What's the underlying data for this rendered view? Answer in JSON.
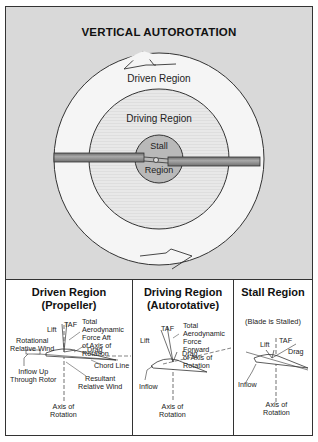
{
  "title": "VERTICAL AUTOROTATION",
  "rotor_diagram": {
    "outer_region_label": "Driven Region",
    "middle_region_label": "Driving Region",
    "inner_region_label_line1": "Stall",
    "inner_region_label_line2": "Region",
    "colors": {
      "background": "#d9d9d9",
      "driven_region": "#f4f4f4",
      "driving_region": "#e6e6e6",
      "stall_region": "#b8b8b8",
      "blade": "#8e8e8e",
      "outline": "#333333"
    }
  },
  "panels": [
    {
      "title_line1": "Driven Region",
      "title_line2": "(Propeller)",
      "labels": {
        "taf_desc_1": "Total",
        "taf_desc_2": "Aerodynamic",
        "taf_desc_3": "Force Aft",
        "taf_desc_4": "of Axis of",
        "taf_desc_5": "Rotation",
        "lift": "Lift",
        "taf": "TAF",
        "rot_wind_1": "Rotational",
        "rot_wind_2": "Relative Wind",
        "drag": "Drag",
        "chord": "Chord Line",
        "inflow_1": "Inflow Up",
        "inflow_2": "Through Rotor",
        "resultant_1": "Resultant",
        "resultant_2": "Relative Wind",
        "axis_1": "Axis of",
        "axis_2": "Rotation"
      }
    },
    {
      "title_line1": "Driving Region",
      "title_line2": "(Autorotative)",
      "labels": {
        "taf_desc_1": "Total",
        "taf_desc_2": "Aerodynamic",
        "taf_desc_3": "Force",
        "taf_desc_4": "Forward",
        "taf_desc_5": "of Axis of",
        "taf_desc_6": "Rotation",
        "lift": "Lift",
        "taf": "TAF",
        "drag": "Drag",
        "inflow": "Inflow",
        "axis_1": "Axis of",
        "axis_2": "Rotation"
      }
    },
    {
      "title_line1": "Stall Region",
      "subtitle": "(Blade is Stalled)",
      "labels": {
        "lift": "Lift",
        "taf": "TAF",
        "drag": "Drag",
        "inflow": "Inflow",
        "axis_1": "Axis of",
        "axis_2": "Rotation"
      }
    }
  ]
}
